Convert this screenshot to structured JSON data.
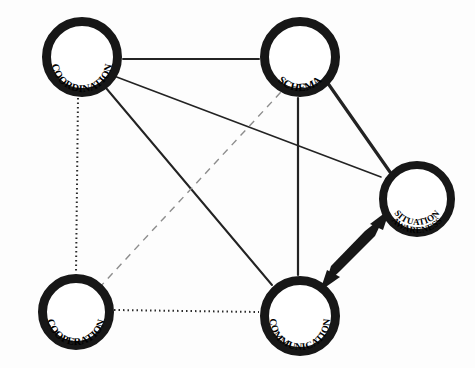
{
  "diagram": {
    "background_color": "#fdfdfd",
    "node_stroke_color": "#171717",
    "node_fill_color": "#ffffff",
    "edge_solid_color": "#232323",
    "edge_dotted_color": "#2b2b2b",
    "edge_dashed_color": "#8d8d8d",
    "arrow_color": "#171717",
    "nodes": [
      {
        "id": "coordination",
        "label": "COORDINATION",
        "lines": [
          "COORDINATION"
        ],
        "cx": 82,
        "cy": 57,
        "radius": 40,
        "ring_width": 9,
        "text_position": "arc-bottom-inside"
      },
      {
        "id": "schema",
        "label": "SCHEMA",
        "lines": [
          "SCHEMA"
        ],
        "cx": 300,
        "cy": 57,
        "radius": 40,
        "ring_width": 9,
        "text_position": "arc-bottom-inside"
      },
      {
        "id": "situation_awareness",
        "label": "SITUATION AWARENESS",
        "lines": [
          "SITUATION",
          "AWARENESS"
        ],
        "cx": 417,
        "cy": 199,
        "radius": 38,
        "ring_width": 8,
        "text_position": "arc-bottom-inside-two-line"
      },
      {
        "id": "cooperation",
        "label": "COOPERATION",
        "lines": [
          "COOPERATION"
        ],
        "cx": 76,
        "cy": 312,
        "radius": 38,
        "ring_width": 9,
        "text_position": "arc-bottom-inside"
      },
      {
        "id": "communication",
        "label": "COMMUNICATION",
        "lines": [
          "COMMUNICATION"
        ],
        "cx": 300,
        "cy": 316,
        "radius": 40,
        "ring_width": 9,
        "text_position": "arc-bottom-inside"
      }
    ],
    "edges": [
      {
        "id": "coordination-schema",
        "from": "coordination",
        "to": "schema",
        "style": "solid",
        "width": 2,
        "arrow": "none"
      },
      {
        "id": "coordination-cooperation",
        "from": "coordination",
        "to": "cooperation",
        "style": "dotted",
        "width": 2,
        "arrow": "none"
      },
      {
        "id": "coordination-situation_awareness",
        "from": "coordination",
        "to": "situation_awareness",
        "style": "solid",
        "width": 1.6,
        "arrow": "none"
      },
      {
        "id": "coordination-communication",
        "from": "coordination",
        "to": "communication",
        "style": "solid",
        "width": 2,
        "arrow": "none"
      },
      {
        "id": "schema-communication",
        "from": "schema",
        "to": "communication",
        "style": "solid",
        "width": 2.2,
        "arrow": "none"
      },
      {
        "id": "schema-situation_awareness",
        "from": "schema",
        "to": "situation_awareness",
        "style": "solid",
        "width": 3.2,
        "arrow": "none"
      },
      {
        "id": "cooperation-schema",
        "from": "cooperation",
        "to": "schema",
        "style": "dashed",
        "width": 1.4,
        "arrow": "none"
      },
      {
        "id": "cooperation-communication",
        "from": "cooperation",
        "to": "communication",
        "style": "dotted",
        "width": 2,
        "arrow": "none"
      },
      {
        "id": "communication-situation_awareness",
        "from": "communication",
        "to": "situation_awareness",
        "style": "thick-arrow",
        "width": 13,
        "arrow": "double"
      }
    ]
  }
}
